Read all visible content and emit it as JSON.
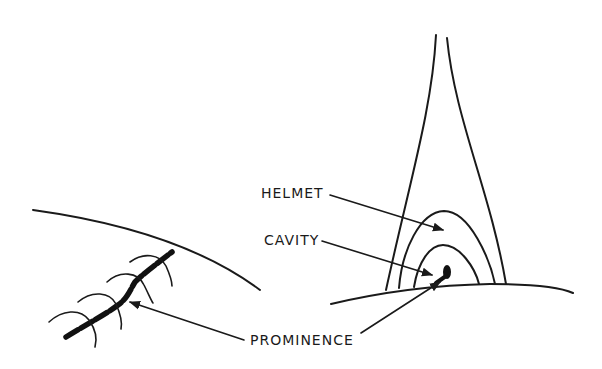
{
  "diagram": {
    "title": "",
    "labels": {
      "helmet": "HELMET",
      "cavity": "CAVITY",
      "prominence": "PROMINENCE"
    },
    "colors": {
      "ink": "#1a1a1a",
      "background": "#ffffff"
    }
  }
}
